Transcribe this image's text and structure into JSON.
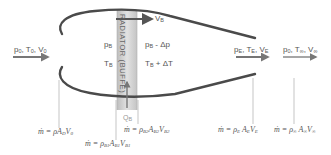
{
  "diagram": {
    "title": "",
    "radiator": {
      "label": "RADIATOR (BUFFE)",
      "fill": "#d4d4d4",
      "edge": "#bcbcbc"
    },
    "colors": {
      "duct": "#4a4a4a",
      "arrow": "#555555",
      "leader": "#999999",
      "text": "#555555"
    },
    "stations": {
      "freestream_in": {
        "p": "p",
        "p_sub": "0",
        "T": "T",
        "T_sub": "0",
        "V": "V",
        "V_sub": "0"
      },
      "radiator_upstream": {
        "p": "p",
        "p_sub": "B",
        "T": "T",
        "T_sub": "B"
      },
      "radiator_downstream": {
        "p": "p",
        "p_sub": "B",
        "p_suffix": " - Δp",
        "T": "T",
        "T_sub": "B",
        "T_suffix": " + ΔT"
      },
      "bypass_velocity": {
        "V": "V",
        "V_sub": "B"
      },
      "heat_input": {
        "Q": "Q",
        "Q_sub": "B"
      },
      "exit": {
        "p": "p",
        "p_sub": "E",
        "T": "T",
        "T_sub": "E",
        "V": "V",
        "V_sub": "E"
      },
      "far_wake": {
        "p": "p",
        "p_sub": "0",
        "T": "T",
        "T_sub": "∞",
        "V": "V",
        "V_sub": "∞"
      }
    },
    "formulas": [
      {
        "id": "inlet",
        "lhs": "ṁ = ρ",
        "A": "A",
        "A_sub": "D",
        "V": "V",
        "V_sub": "0",
        "rho_sub": ""
      },
      {
        "id": "radiator_in",
        "lhs": "ṁ = ρ",
        "rho_sub": "B1",
        "A": "A",
        "A_sub": "B1",
        "V": "V",
        "V_sub": "B1"
      },
      {
        "id": "radiator_out",
        "lhs": "ṁ = ρ",
        "rho_sub": "B2",
        "A": "A",
        "A_sub": "B2",
        "V": "V",
        "V_sub": "B2"
      },
      {
        "id": "exit",
        "lhs": "ṁ = ρ",
        "rho_sub": "E",
        "A": "A",
        "A_sub": "E",
        "V": "V",
        "V_sub": "E"
      },
      {
        "id": "far_wake",
        "lhs": "ṁ = ρ",
        "rho_sub": "∞",
        "A": "A",
        "A_sub": "∞",
        "V": "V",
        "V_sub": "∞"
      }
    ],
    "icons": {
      "flow_arrow": "right-arrow",
      "heat_arrow": "up-arrow"
    }
  }
}
